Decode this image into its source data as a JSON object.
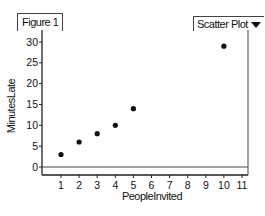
{
  "figure_tab": "Figure 1",
  "plot_type_selector": "Scatter Plot",
  "chart_data": {
    "type": "scatter",
    "title": "",
    "xlabel": "PeopleInvited",
    "ylabel": "MinutesLate",
    "x": [
      1,
      2,
      3,
      4,
      5,
      10
    ],
    "y": [
      3,
      6,
      8,
      10,
      14,
      29
    ],
    "xticks": [
      1,
      2,
      3,
      4,
      5,
      6,
      7,
      8,
      9,
      10,
      11
    ],
    "yticks": [
      0,
      5,
      10,
      15,
      20,
      25,
      30
    ],
    "xlim": [
      0,
      11.3
    ],
    "ylim": [
      -2,
      31
    ],
    "grid": false,
    "reference_line": {
      "y": 0
    }
  }
}
